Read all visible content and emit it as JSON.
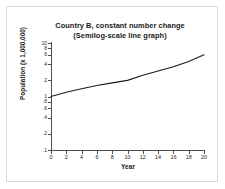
{
  "chart_data": {
    "type": "line",
    "title": "Country B, constant number change",
    "subtitle": "(Semilog-scale line graph)",
    "title_lines": [
      "Country B, constant number change",
      "(Semilog-scale line graph)"
    ],
    "xlabel": "Year",
    "ylabel": "Population (x 1,000,000)",
    "yscale": "log",
    "xscale": "linear",
    "xlim": [
      0,
      20
    ],
    "ylim": [
      0.1,
      10
    ],
    "grid": false,
    "legend": null,
    "x_ticks": [
      0,
      2,
      4,
      6,
      8,
      10,
      12,
      14,
      16,
      18,
      20
    ],
    "x_tick_labels": [
      "0",
      "2",
      "4",
      "6",
      "8",
      "10",
      "12",
      "14",
      "16",
      "18",
      "20"
    ],
    "y_ticks": [
      10,
      8,
      6,
      4,
      2,
      1,
      0.8,
      0.6,
      0.4,
      0.2,
      0.1
    ],
    "y_tick_labels": [
      "10",
      "8",
      "6",
      "4",
      "2",
      "1",
      ".8",
      ".6",
      ".4",
      ".2",
      ".1"
    ],
    "series": [
      {
        "name": "Country B population",
        "color": "#1a1a1a",
        "x": [
          0,
          2,
          4,
          6,
          8,
          10,
          12,
          14,
          16,
          18,
          20
        ],
        "values": [
          1.0,
          1.2,
          1.4,
          1.6,
          1.8,
          2.0,
          2.5,
          3.0,
          3.6,
          4.5,
          6.0
        ]
      }
    ]
  },
  "figure": {
    "background_color": "#ffffff",
    "border_color": "#d9d9d9",
    "axis_color": "#4d4d4d",
    "text_color": "#1a1a1a"
  }
}
